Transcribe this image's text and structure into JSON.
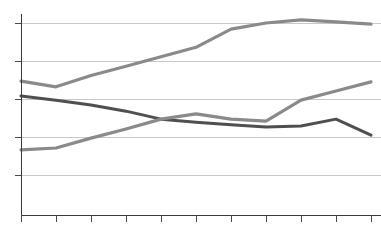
{
  "chart_data": {
    "type": "line",
    "title": "",
    "subtitle": "",
    "xlabel": "",
    "ylabel": "",
    "grid": "horizontal",
    "legend": "none",
    "xlim": [
      0,
      10
    ],
    "ylim": [
      0,
      5
    ],
    "x": [
      0,
      1,
      2,
      3,
      4,
      5,
      6,
      7,
      8,
      9,
      10
    ],
    "xtick_labels": [
      "",
      "",
      "",
      "",
      "",
      "",
      "",
      "",
      "",
      "",
      ""
    ],
    "ytick_labels": [
      "",
      "",
      "",
      "",
      ""
    ],
    "ygrid_values": [
      4,
      3,
      2,
      1,
      0
    ],
    "series": [
      {
        "name": "series-1",
        "color": "#8a8a8a",
        "width": 3.2,
        "values": [
          2.47,
          2.32,
          2.62,
          2.86,
          3.11,
          3.36,
          3.84,
          4.0,
          4.08,
          4.03,
          3.97
        ]
      },
      {
        "name": "series-2",
        "color": "#4f4f4f",
        "width": 3.0,
        "values": [
          2.08,
          1.97,
          1.84,
          1.68,
          1.47,
          1.39,
          1.32,
          1.26,
          1.29,
          1.47,
          1.05
        ]
      },
      {
        "name": "series-3",
        "color": "#8a8a8a",
        "width": 3.2,
        "values": [
          0.66,
          0.71,
          0.97,
          1.21,
          1.47,
          1.61,
          1.47,
          1.42,
          1.97,
          2.21,
          2.45
        ]
      }
    ]
  },
  "geometry": {
    "plot_left": 21,
    "plot_right": 381,
    "plot_top": 14,
    "plot_bottom": 215,
    "gridline_y": [
      23,
      61,
      99,
      137,
      175
    ],
    "tick_x": [
      21,
      56,
      91,
      126,
      161,
      196,
      231,
      266,
      301,
      336,
      371
    ],
    "tick_length": 7,
    "background": "#ffffff",
    "grid_color": "#c8c8c8",
    "axis_color": "#3a3a3a"
  }
}
